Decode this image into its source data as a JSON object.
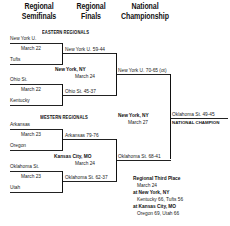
{
  "headers": {
    "round1_line1": "Regional",
    "round1_line2": "Semifinals",
    "round2_line1": "Regional",
    "round2_line2": "Finals",
    "round3_line1": "National",
    "round3_line2": "Championship"
  },
  "eastern": {
    "title": "EASTERN REGIONALS",
    "game1": {
      "team_top": "New York U.",
      "date": "March 22",
      "team_bottom": "Tufts"
    },
    "game2": {
      "team_top": "Ohio St.",
      "date": "March 22",
      "team_bottom": "Kentucky"
    },
    "final": {
      "location": "New York, NY",
      "date": "March 24",
      "winner_top": "New York U. 59-44",
      "winner_bottom": "Ohio St. 45-37"
    }
  },
  "western": {
    "title": "WESTERN REGIONALS",
    "game1": {
      "team_top": "Arkansas",
      "date": "March 23",
      "team_bottom": "Oregon"
    },
    "game2": {
      "team_top": "Oklahoma St.",
      "date": "March 23",
      "team_bottom": "Utah"
    },
    "final": {
      "location": "Kansas City, MO",
      "date": "March 24",
      "winner_top": "Arkansas 79-76",
      "winner_bottom": "Oklahoma St. 62-37"
    }
  },
  "national": {
    "location": "New York, NY",
    "date": "March 27",
    "finalist_east": "New York U. 70-65 (ot)",
    "finalist_west": "Oklahoma St. 68-41",
    "champion": "Oklahoma St. 49-45",
    "champion_label": "NATIONAL CHAMPION"
  },
  "third_place": {
    "title": "Regional Third Place",
    "date": "March 24",
    "site1": "at New York, NY",
    "result1": "Kentucky 66, Tufts 56",
    "site2": "at Kansas City, MO",
    "result2": "Oregon 69, Utah 66"
  }
}
